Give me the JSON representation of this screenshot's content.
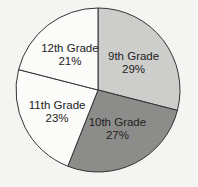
{
  "chart_data": {
    "type": "pie",
    "title": "",
    "categories": [
      "9th Grade",
      "10th Grade",
      "11th Grade",
      "12th Grade"
    ],
    "values": [
      29,
      27,
      23,
      21
    ],
    "labels": [
      "29%",
      "27%",
      "23%",
      "21%"
    ],
    "colors": [
      "#cdcdcb",
      "#8c8c8a",
      "#fbfbf9",
      "#fbfbf9"
    ],
    "start_angle": "12 o'clock, clockwise",
    "legend": "none (labels inside slices)"
  }
}
